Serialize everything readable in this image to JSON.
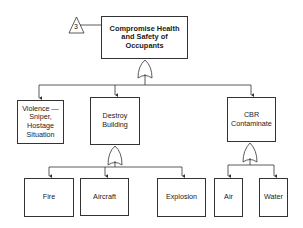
{
  "diagram": {
    "type": "fault-tree",
    "transfer_ref": "3",
    "root": {
      "label": "Compromise Health and Safety of Occupants",
      "gate": "OR"
    },
    "level1": [
      {
        "label": "Violence — Sniper, Hostage Situation"
      },
      {
        "label": "Destroy Building",
        "gate": "OR"
      },
      {
        "label": "CBR Contaminate",
        "gate": "OR"
      }
    ],
    "destroy_children": [
      {
        "label": "Fire"
      },
      {
        "label": "Aircraft"
      },
      {
        "label": "Explosion"
      }
    ],
    "cbr_children": [
      {
        "label": "Air"
      },
      {
        "label": "Water"
      }
    ],
    "colors": {
      "line": "#333333",
      "background": "#ffffff",
      "text": "#1a1a1a"
    }
  }
}
